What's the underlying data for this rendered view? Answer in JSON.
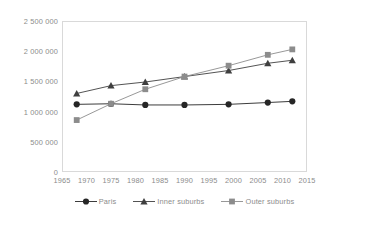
{
  "chart_data": {
    "type": "line",
    "title": "",
    "subtitle": "",
    "xlabel": "",
    "ylabel": "",
    "x": [
      1968,
      1975,
      1982,
      1990,
      1999,
      2007,
      2012
    ],
    "xlim": [
      1965,
      2015
    ],
    "ylim": [
      0,
      2500000
    ],
    "x_ticks": [
      1965,
      1970,
      1975,
      1980,
      1985,
      1990,
      1995,
      2000,
      2005,
      2010,
      2015
    ],
    "x_tick_labels": [
      "1965",
      "1970",
      "1975",
      "1980",
      "1985",
      "1990",
      "1995",
      "2000",
      "2005",
      "2010",
      "2015"
    ],
    "y_ticks": [
      0,
      500000,
      1000000,
      1500000,
      2000000,
      2500000
    ],
    "y_tick_labels": [
      "0",
      "500 000",
      "1 000 000",
      "1 500 000",
      "2 000 000",
      "2 500 000"
    ],
    "grid": false,
    "legend_position": "bottom",
    "series": [
      {
        "name": "Paris",
        "marker": "circle",
        "color": "#262626",
        "values": [
          1120000,
          1130000,
          1110000,
          1110000,
          1120000,
          1150000,
          1170000
        ]
      },
      {
        "name": "Inner suburbs",
        "marker": "triangle",
        "color": "#3f3f3f",
        "values": [
          1300000,
          1430000,
          1490000,
          1580000,
          1680000,
          1800000,
          1850000
        ]
      },
      {
        "name": "Outer suburbs",
        "marker": "square",
        "color": "#8c8c8c",
        "values": [
          860000,
          1130000,
          1370000,
          1580000,
          1760000,
          1940000,
          2030000
        ]
      }
    ]
  },
  "legend": {
    "items": [
      {
        "label": "Paris",
        "marker": "circle-marker-icon"
      },
      {
        "label": "Inner suburbs",
        "marker": "triangle-marker-icon"
      },
      {
        "label": "Outer suburbs",
        "marker": "square-marker-icon"
      }
    ]
  },
  "colors": {
    "paris": "#262626",
    "inner_suburbs": "#3f3f3f",
    "outer_suburbs": "#8c8c8c",
    "axis_line": "#d9d9d9",
    "text": "#8c8c8c",
    "background": "#ffffff"
  }
}
